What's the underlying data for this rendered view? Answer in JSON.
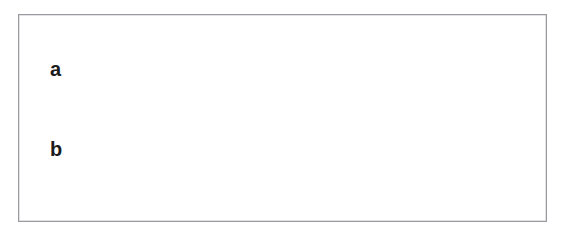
{
  "figure": {
    "background_color": "#ffffff",
    "frame_color": "#9a9a9e",
    "width": 565,
    "height": 238
  },
  "labels": [
    {
      "id": "a",
      "text": "a",
      "describes": "balloon-catheter",
      "x": 50,
      "y": 59
    },
    {
      "id": "b",
      "text": "b",
      "describes": "guidewire",
      "x": 50,
      "y": 139
    }
  ],
  "colors": {
    "vessel_wall_line": "#e8503c",
    "vessel_wall_light": "#f2a396",
    "vessel_lumen_fill": "#f7c9c0",
    "vessel_lumen_pale": "#fae6e1",
    "stent_strut": "#6e7478",
    "stent_strut_dark": "#4b5054",
    "stent_strut_light": "#b9bec1",
    "catheter_blue": "#6b83ad",
    "catheter_blue_dark": "#3f5a88",
    "catheter_blue_light": "#9fb2d2",
    "balloon_fill": "#8ea7c9",
    "guidewire": "#5b719c",
    "label_text": "#1b1b1b",
    "frame_border": "#9a9a9e"
  },
  "components": {
    "vessel": {
      "name": "bifurcated-artery",
      "main_trunk": "horizontal vessel entering from left",
      "branch_upper": "superior branch angling up-right",
      "branch_lower": "inferior branch angling down-right",
      "bifurcation_x": 392
    },
    "stent": {
      "name": "expanded-metal-stent",
      "pattern": "diamond zigzag mesh",
      "start_x": 190,
      "end_x": 400,
      "ring_count": 9
    },
    "balloon_catheter": {
      "name": "balloon-catheter",
      "label": "a",
      "shape": "spindle balloon on shaft with distal tip",
      "shaft_start_x": 62,
      "balloon_start_x": 92,
      "balloon_end_x": 158,
      "tip_end_x": 178
    },
    "guidewire": {
      "name": "guidewire",
      "label": "b",
      "path": "enters lower-left, runs through stent, exits inferior branch at lower right",
      "start_x": 62,
      "end_x": 520
    }
  }
}
